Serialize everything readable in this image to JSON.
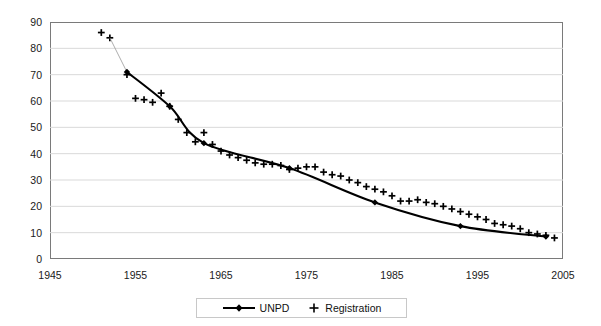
{
  "chart_data": {
    "type": "scatter",
    "title": "",
    "xlabel": "",
    "ylabel": "",
    "xlim": [
      1945,
      2005
    ],
    "ylim": [
      0,
      90
    ],
    "grid": true,
    "legend_position": "bottom",
    "xticks": [
      "1945",
      "1955",
      "1965",
      "1975",
      "1985",
      "1995",
      "2005"
    ],
    "xtick_values": [
      1945,
      1955,
      1965,
      1975,
      1985,
      1995,
      2005
    ],
    "yticks": [
      "0",
      "10",
      "20",
      "30",
      "40",
      "50",
      "60",
      "70",
      "80",
      "90"
    ],
    "ytick_values": [
      0,
      10,
      20,
      30,
      40,
      50,
      60,
      70,
      80,
      90
    ],
    "series": [
      {
        "name": "UNPD",
        "marker": "diamond",
        "style": "line-with-markers",
        "color": "#000000",
        "x": [
          1954,
          1959,
          1963,
          1973,
          1983,
          1993,
          2003
        ],
        "values": [
          71.0,
          58.0,
          44.0,
          34.5,
          21.5,
          12.5,
          8.5
        ]
      },
      {
        "name": "Registration",
        "marker": "plus",
        "style": "markers-only",
        "color": "#000000",
        "x": [
          1951,
          1952,
          1954,
          1955,
          1956,
          1957,
          1958,
          1959,
          1960,
          1961,
          1962,
          1963,
          1964,
          1965,
          1966,
          1967,
          1968,
          1969,
          1970,
          1971,
          1972,
          1973,
          1974,
          1975,
          1976,
          1977,
          1978,
          1979,
          1980,
          1981,
          1982,
          1983,
          1984,
          1985,
          1986,
          1987,
          1988,
          1989,
          1990,
          1991,
          1992,
          1993,
          1994,
          1995,
          1996,
          1997,
          1998,
          1999,
          2000,
          2001,
          2002,
          2003,
          2004
        ],
        "values": [
          86.0,
          84.0,
          70.0,
          61.0,
          60.5,
          59.5,
          63.0,
          58.0,
          53.0,
          48.0,
          44.5,
          48.0,
          43.5,
          41.0,
          39.5,
          38.5,
          37.5,
          36.5,
          36.0,
          36.0,
          35.5,
          34.0,
          34.5,
          35.0,
          35.0,
          33.0,
          32.0,
          31.5,
          30.0,
          29.0,
          27.5,
          26.5,
          25.5,
          24.0,
          22.0,
          22.0,
          22.5,
          21.5,
          21.0,
          20.0,
          19.0,
          18.0,
          17.0,
          16.0,
          15.0,
          13.5,
          13.0,
          12.5,
          11.5,
          10.0,
          9.5,
          9.0,
          8.0
        ]
      }
    ]
  },
  "legend": {
    "items": [
      {
        "label": "UNPD",
        "marker": "line-diamond"
      },
      {
        "label": "Registration",
        "marker": "plus"
      }
    ]
  },
  "axes": {
    "x_labels": [
      "1945",
      "1955",
      "1965",
      "1975",
      "1985",
      "1995",
      "2005"
    ],
    "y_labels": [
      "90",
      "80",
      "70",
      "60",
      "50",
      "40",
      "30",
      "20",
      "10",
      "0"
    ]
  },
  "colors": {
    "line": "#000000",
    "marker": "#000000",
    "grid": "#d9d9d9",
    "frame": "#7a7a7a",
    "background": "#ffffff",
    "text": "#1a1a1a"
  }
}
